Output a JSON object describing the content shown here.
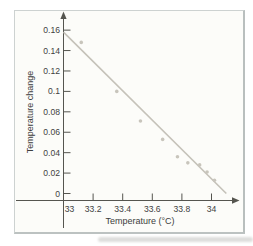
{
  "figure": {
    "background_color": "#fcfcf9",
    "frame_border_color": "#cdd2d1",
    "marker_color": "#c8c5bc",
    "fit_line_color": "#c5c2b9",
    "axis_color": "#55554f",
    "text_color": "#3f3f3f"
  },
  "chart_data": {
    "type": "scatter",
    "title": "",
    "xlabel": "Temperature (°C)",
    "ylabel": "Temperature change",
    "xlim": [
      33,
      34.15
    ],
    "ylim": [
      0,
      0.165
    ],
    "grid": false,
    "legend": false,
    "x_tick_values": [
      33,
      33.2,
      33.4,
      33.6,
      33.8,
      34
    ],
    "x_tick_labels": [
      "33",
      "33.2",
      "33.4",
      "33.6",
      "33.8",
      "34"
    ],
    "y_tick_values": [
      0,
      0.02,
      0.04,
      0.06,
      0.08,
      0.1,
      0.12,
      0.14,
      0.16
    ],
    "y_tick_labels": [
      "0",
      "0.02",
      "0.04",
      "0.06",
      "0.08",
      "0.1",
      "0.12",
      "0.14",
      "0.16"
    ],
    "points": [
      {
        "x": 33.12,
        "y": 0.148
      },
      {
        "x": 33.36,
        "y": 0.1
      },
      {
        "x": 33.52,
        "y": 0.071
      },
      {
        "x": 33.67,
        "y": 0.053
      },
      {
        "x": 33.77,
        "y": 0.036
      },
      {
        "x": 33.84,
        "y": 0.03
      },
      {
        "x": 33.92,
        "y": 0.028
      },
      {
        "x": 33.97,
        "y": 0.021
      },
      {
        "x": 34.02,
        "y": 0.013
      }
    ],
    "fit_line": {
      "x1": 33.0,
      "y1": 0.158,
      "x2": 34.1,
      "y2": 0.0
    }
  }
}
